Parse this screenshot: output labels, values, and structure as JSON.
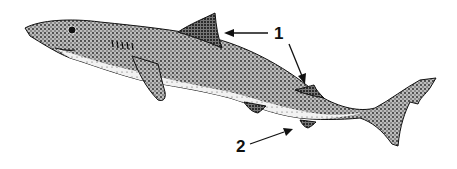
{
  "figure": {
    "colors": {
      "ink": "#111111",
      "background": "#ffffff",
      "body_light": "#e8e8e8"
    }
  },
  "labels": [
    {
      "id": "label-1",
      "text": "1",
      "targets": [
        "first-dorsal-fin",
        "second-dorsal-fin"
      ]
    },
    {
      "id": "label-2",
      "text": "2",
      "targets": [
        "anal-fin"
      ]
    }
  ]
}
